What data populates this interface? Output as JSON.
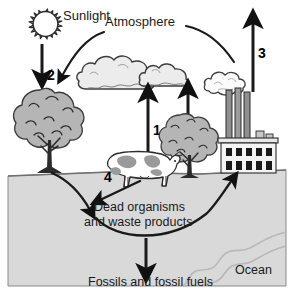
{
  "diagram": {
    "width": 294,
    "height": 299,
    "labels": {
      "sunlight": "Sunlight",
      "atmosphere": "Atmosphere",
      "dead_organisms_line1": "Dead organisms",
      "dead_organisms_line2": "and waste products",
      "fossils": "Fossils and fossil fuels",
      "ocean": "Ocean"
    },
    "numbered_arrows": [
      {
        "id": "1",
        "label": "1",
        "meaning": "respiration-from-cow-to-atmosphere"
      },
      {
        "id": "2",
        "label": "2",
        "meaning": "sunlight-to-tree-photosynthesis"
      },
      {
        "id": "3",
        "label": "3",
        "meaning": "factory-emissions-to-atmosphere"
      },
      {
        "id": "4",
        "label": "4",
        "meaning": "organisms-to-dead-organisms"
      }
    ],
    "elements": [
      {
        "name": "sun",
        "icon": "sun-icon"
      },
      {
        "name": "cloud-left",
        "icon": "cloud-icon"
      },
      {
        "name": "cloud-right",
        "icon": "cloud-icon"
      },
      {
        "name": "tree-left",
        "icon": "tree-icon"
      },
      {
        "name": "tree-middle",
        "icon": "tree-icon"
      },
      {
        "name": "cow",
        "icon": "cow-icon"
      },
      {
        "name": "factory",
        "icon": "factory-icon"
      },
      {
        "name": "smoke",
        "icon": "smoke-icon"
      },
      {
        "name": "ocean-river",
        "icon": "river-icon"
      },
      {
        "name": "ground",
        "icon": "ground-icon"
      }
    ],
    "colors": {
      "background": "#ffffff",
      "ground": "#d9d9d9",
      "ground_stroke": "#7a7a7a",
      "cloud_fill": "#ececec",
      "cloud_stroke": "#3c3c3c",
      "foliage": "#b5b5b5",
      "trunk": "#2b2b2b",
      "factory_wall": "#f2f2f2",
      "window": "#1a1a1a",
      "stack": "#8c8c8c",
      "ink": "#1a1a1a",
      "river": "#bdbdbd",
      "cow_body": "#ffffff",
      "cow_spot": "#9a9a9a"
    }
  }
}
